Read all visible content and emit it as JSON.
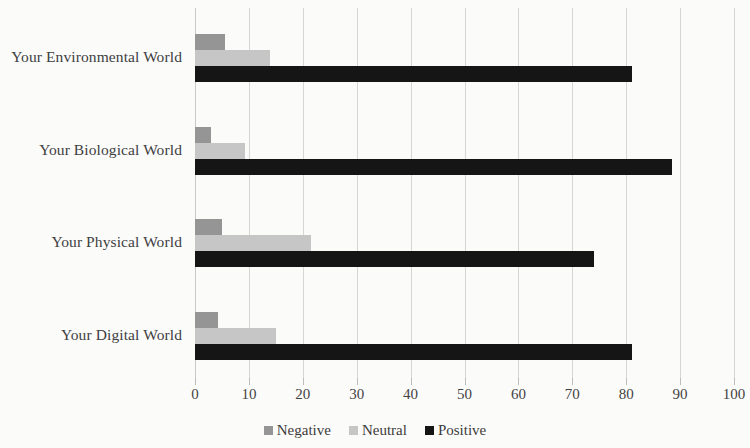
{
  "chart_data": {
    "type": "bar",
    "orientation": "horizontal",
    "title": "",
    "subtitle": "",
    "xlabel": "",
    "ylabel": "",
    "xlim": [
      0,
      100
    ],
    "xticks": [
      0,
      10,
      20,
      30,
      40,
      50,
      60,
      70,
      80,
      90,
      100
    ],
    "xtick_labels": [
      "0",
      "10",
      "20",
      "30",
      "40",
      "50",
      "60",
      "70",
      "80",
      "90",
      "100"
    ],
    "grid": "vertical",
    "legend_position": "bottom-center",
    "categories": [
      "Your Environmental World",
      "Your Biological World",
      "Your Physical World",
      "Your Digital World"
    ],
    "series": [
      {
        "name": "Negative",
        "color": "#959595",
        "values": [
          5.5,
          3,
          5,
          4.3
        ]
      },
      {
        "name": "Neutral",
        "color": "#c6c6c6",
        "values": [
          14,
          9.3,
          21.5,
          15
        ]
      },
      {
        "name": "Positive",
        "color": "#151515",
        "values": [
          81,
          88.5,
          74,
          81
        ]
      }
    ]
  },
  "legend": {
    "items": [
      {
        "label": "Negative",
        "color": "#959595"
      },
      {
        "label": "Neutral",
        "color": "#c6c6c6"
      },
      {
        "label": "Positive",
        "color": "#151515"
      }
    ]
  }
}
